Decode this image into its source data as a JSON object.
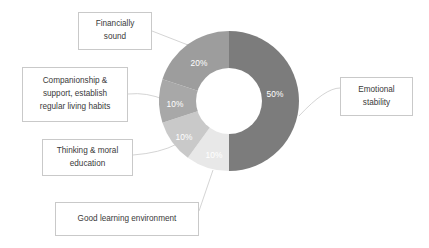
{
  "chart_data": {
    "type": "pie",
    "variant": "donut",
    "title": "",
    "xlabel": "",
    "ylabel": "",
    "legend_position": "callout-labels",
    "grid": false,
    "start_angle_deg": 0,
    "direction": "clockwise",
    "center": {
      "x": 229,
      "y": 101
    },
    "outer_radius": 70,
    "inner_radius": 33,
    "categories": [
      "Emotional stability",
      "Good learning environment",
      "Thinking & moral education",
      "Companionship & support, establish regular living habits",
      "Financially sound"
    ],
    "values": [
      50,
      10,
      10,
      10,
      20
    ],
    "value_labels": [
      "50%",
      "10%",
      "10%",
      "10%",
      "20%"
    ],
    "colors": [
      "#7c7c7c",
      "#e8e8e8",
      "#c9c9c9",
      "#a8a8a8",
      "#9d9d9d"
    ],
    "slices": [
      {
        "label": "Emotional stability",
        "value": 50,
        "value_label": "50%",
        "color": "#7c7c7c",
        "start_deg": 0,
        "end_deg": 180,
        "label_x": 275,
        "label_y": 94
      },
      {
        "label": "Good learning environment",
        "value": 10,
        "value_label": "10%",
        "color": "#e8e8e8",
        "start_deg": 180,
        "end_deg": 216,
        "label_x": 214,
        "label_y": 155
      },
      {
        "label": "Thinking & moral education",
        "value": 10,
        "value_label": "10%",
        "color": "#c9c9c9",
        "start_deg": 216,
        "end_deg": 252,
        "label_x": 184,
        "label_y": 137
      },
      {
        "label": "Companionship & support, establish regular living habits",
        "value": 10,
        "value_label": "10%",
        "color": "#a8a8a8",
        "start_deg": 252,
        "end_deg": 288,
        "label_x": 175,
        "label_y": 104
      },
      {
        "label": "Financially sound",
        "value": 20,
        "value_label": "20%",
        "color": "#9d9d9d",
        "start_deg": 288,
        "end_deg": 360,
        "label_x": 199,
        "label_y": 63
      }
    ]
  },
  "callouts": {
    "financially_sound": {
      "line1": "Financially",
      "line2": "sound"
    },
    "companionship": {
      "line1": "Companionship &",
      "line2": "support, establish",
      "line3": "regular living habits"
    },
    "thinking": {
      "line1": "Thinking & moral",
      "line2": "education"
    },
    "good_learning": {
      "line1": "Good learning environment"
    },
    "emotional": {
      "line1": "Emotional",
      "line2": "stability"
    }
  },
  "style": {
    "background": "#ffffff",
    "callout_border": "#c9c9c9",
    "callout_text": "#3a3a3a",
    "leader_line": "#c9c9c9",
    "slice_label_text": "#ffffff",
    "donut_hole": "#ffffff"
  }
}
